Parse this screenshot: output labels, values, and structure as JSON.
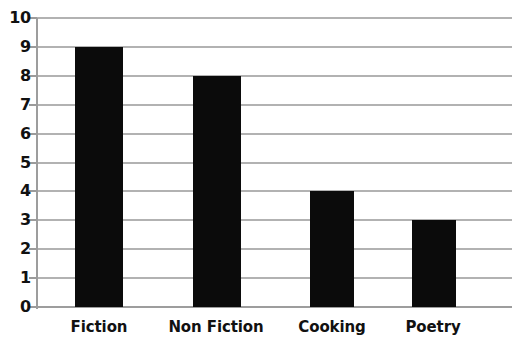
{
  "chart_data": {
    "type": "bar",
    "title": "",
    "subtitle": "",
    "xlabel": "",
    "ylabel": "",
    "categories": [
      "Fiction",
      "Non Fiction",
      "Cooking",
      "Poetry"
    ],
    "values": [
      9,
      8,
      4,
      3
    ],
    "ylim": [
      0,
      10
    ],
    "y_ticks": [
      10,
      9,
      8,
      7,
      6,
      5,
      4,
      3,
      2,
      1,
      0
    ],
    "grid": "horizontal",
    "legend": "none",
    "bar_color": "#0b0b0b",
    "grid_color": "#b2b2b2",
    "axis_color": "#9d9d9d",
    "background": "#ffffff",
    "annotations": []
  }
}
